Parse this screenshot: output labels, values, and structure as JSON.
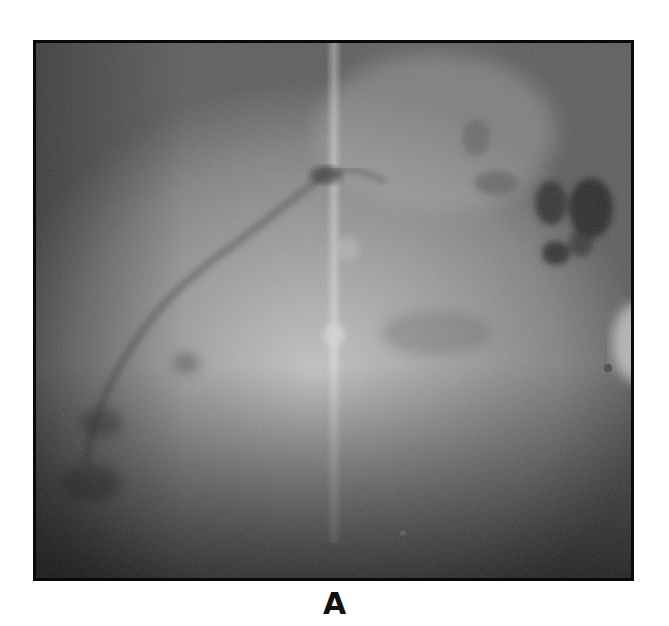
{
  "figure": {
    "panel_label": "A",
    "image": {
      "description": "grayscale fundus angiography-style image",
      "icon": "grayscale-retinal-image",
      "colors": {
        "border": "#0a0a0a",
        "base_gray": "#7a7a7a",
        "bright_center": "#c8c8c8",
        "dark_lesion": "#2e2e2e",
        "vignette": "#1a1a1a"
      }
    }
  }
}
